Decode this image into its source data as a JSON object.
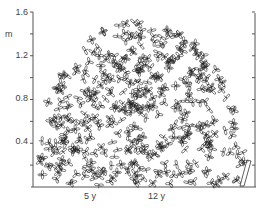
{
  "figure": {
    "type": "plant crown profile drawing",
    "y_axis": {
      "unit": "m",
      "ticks": [
        "1.6",
        "1.2",
        "0.8",
        "0.4"
      ],
      "tick_values": [
        1.6,
        1.2,
        0.8,
        0.4
      ],
      "minor_ticks": [
        1.4,
        1.0,
        0.6,
        0.2
      ],
      "range": [
        0,
        1.6
      ]
    },
    "x_markers": [
      {
        "label": "5 y",
        "x": 90
      },
      {
        "label": "12 y",
        "x": 155
      }
    ],
    "colors": {
      "line": "#222222",
      "axis": "#555555",
      "background": "#ffffff"
    }
  }
}
